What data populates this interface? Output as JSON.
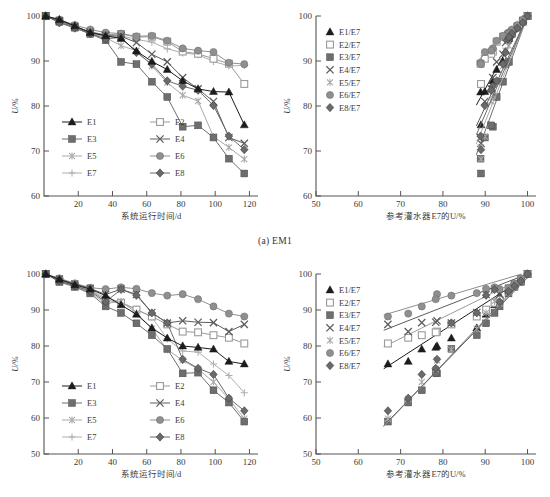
{
  "figure": {
    "caption_a": "(a) EM1"
  },
  "series_colors": {
    "E1": "#1c1c1c",
    "E2": "#9a9a9a",
    "E3": "#6e6e6e",
    "E4": "#5c5c5c",
    "E5": "#a9a9a9",
    "E6": "#8f8f8f",
    "E7": "#b0b0b0",
    "E8": "#6a6a6a"
  },
  "series_markers": {
    "E1": "triangle-filled",
    "E2": "square-open",
    "E3": "square-filled",
    "E4": "cross-x",
    "E5": "asterisk",
    "E6": "circle-filled",
    "E7": "plus",
    "E8": "diamond-filled"
  },
  "panel_top_left": {
    "legend": [
      "E1",
      "E2",
      "E3",
      "E4",
      "E5",
      "E6",
      "E7",
      "E8"
    ],
    "chart_data": {
      "type": "line",
      "title": "",
      "xlabel": "系统运行时间/d",
      "ylabel": "U/%",
      "xlim": [
        0,
        125
      ],
      "ylim": [
        60,
        100
      ],
      "xticks": [
        20,
        40,
        60,
        80,
        100,
        120
      ],
      "yticks": [
        60,
        70,
        80,
        90,
        100
      ],
      "grid": false,
      "x": [
        1,
        9,
        18,
        27,
        36,
        45,
        54,
        63,
        72,
        81,
        90,
        99,
        108,
        117
      ],
      "series": [
        {
          "name": "E1",
          "values": [
            100,
            99.2,
            97.8,
            96.3,
            95.6,
            95.0,
            92.2,
            89.9,
            88.1,
            85.6,
            83.8,
            83.2,
            83.1,
            75.8
          ]
        },
        {
          "name": "E2",
          "values": [
            100,
            98.9,
            97.6,
            96.5,
            95.8,
            96.0,
            95.3,
            95.4,
            94.3,
            92.1,
            91.6,
            90.5,
            89.4,
            84.9
          ]
        },
        {
          "name": "E3",
          "values": [
            100,
            98.7,
            97.4,
            96.0,
            94.6,
            89.8,
            89.3,
            85.4,
            82.0,
            75.4,
            75.7,
            73.0,
            68.3,
            65.0
          ]
        },
        {
          "name": "E4",
          "values": [
            100,
            99.0,
            97.7,
            96.4,
            95.7,
            95.5,
            94.1,
            91.5,
            89.8,
            86.3,
            83.8,
            81.0,
            73.0,
            71.7
          ]
        },
        {
          "name": "E5",
          "values": [
            100,
            98.8,
            97.5,
            96.2,
            95.2,
            93.4,
            92.3,
            88.9,
            85.2,
            82.4,
            81.1,
            73.2,
            70.8,
            68.2
          ]
        },
        {
          "name": "E6",
          "values": [
            100,
            99.2,
            98.0,
            97.0,
            96.3,
            96.1,
            95.5,
            95.6,
            94.5,
            92.8,
            92.3,
            92.0,
            89.6,
            89.3
          ]
        },
        {
          "name": "E7",
          "values": [
            100,
            98.9,
            97.6,
            96.3,
            95.4,
            95.6,
            94.8,
            94.2,
            92.7,
            91.8,
            91.4,
            89.9,
            88.9,
            89.0
          ]
        },
        {
          "name": "E8",
          "values": [
            100,
            98.5,
            97.3,
            96.1,
            94.9,
            95.3,
            91.9,
            89.3,
            85.6,
            84.4,
            83.5,
            80.1,
            73.3,
            70.3
          ]
        }
      ]
    }
  },
  "panel_top_right": {
    "legend": [
      "E1/E7",
      "E2/E7",
      "E3/E7",
      "E4/E7",
      "E5/E7",
      "E6/E7",
      "E8/E7"
    ],
    "chart_data": {
      "type": "scatter",
      "title": "",
      "xlabel": "参考灌水器E7的U/%",
      "ylabel": "U/%",
      "xlim": [
        50,
        102
      ],
      "ylim": [
        60,
        100
      ],
      "xticks": [
        50,
        60,
        70,
        80,
        90,
        100
      ],
      "yticks": [
        60,
        70,
        80,
        90,
        100
      ],
      "grid": false,
      "x_reference_E7": [
        100,
        98.9,
        97.6,
        96.3,
        95.4,
        95.6,
        94.8,
        94.2,
        92.7,
        91.8,
        91.4,
        89.9,
        88.9,
        89.0
      ],
      "series": [
        {
          "name": "E1/E7",
          "values": [
            100,
            99.2,
            97.8,
            96.3,
            95.6,
            95.0,
            92.2,
            89.9,
            88.1,
            85.6,
            83.8,
            83.2,
            83.1,
            75.8
          ],
          "fit_slope": 1.72,
          "fit_intercept": -71.0
        },
        {
          "name": "E2/E7",
          "values": [
            100,
            98.9,
            97.6,
            96.5,
            95.8,
            96.0,
            95.3,
            95.4,
            94.3,
            92.1,
            91.6,
            90.5,
            89.4,
            84.9
          ],
          "fit_slope": 0.92,
          "fit_intercept": 8.3
        },
        {
          "name": "E3/E7",
          "values": [
            100,
            98.7,
            97.4,
            96.0,
            94.6,
            89.8,
            89.3,
            85.4,
            82.0,
            75.4,
            75.7,
            73.0,
            68.3,
            65.0
          ],
          "fit_slope": 2.55,
          "fit_intercept": -155.0
        },
        {
          "name": "E4/E7",
          "values": [
            100,
            99.0,
            97.7,
            96.4,
            95.7,
            95.5,
            94.1,
            91.5,
            89.8,
            86.3,
            83.8,
            81.0,
            73.0,
            71.7
          ],
          "fit_slope": 2.02,
          "fit_intercept": -102.0
        },
        {
          "name": "E5/E7",
          "values": [
            100,
            98.8,
            97.5,
            96.2,
            95.2,
            93.4,
            92.3,
            88.9,
            85.2,
            82.4,
            81.1,
            73.2,
            70.8,
            68.2
          ],
          "fit_slope": 2.35,
          "fit_intercept": -135.0
        },
        {
          "name": "E6/E7",
          "values": [
            100,
            99.2,
            98.0,
            97.0,
            96.3,
            96.1,
            95.5,
            95.6,
            94.5,
            92.8,
            92.3,
            92.0,
            89.6,
            89.3
          ],
          "fit_slope": 0.88,
          "fit_intercept": 12.4
        },
        {
          "name": "E8/E7",
          "values": [
            100,
            98.5,
            97.3,
            96.1,
            94.9,
            95.3,
            91.9,
            89.3,
            85.6,
            84.4,
            83.5,
            80.1,
            73.3,
            70.3
          ],
          "fit_slope": 2.18,
          "fit_intercept": -118.0
        }
      ]
    }
  },
  "panel_bottom_left": {
    "legend": [
      "E1",
      "E2",
      "E3",
      "E4",
      "E5",
      "E6",
      "E7",
      "E8"
    ],
    "chart_data": {
      "type": "line",
      "title": "",
      "xlabel": "系统运行时间/d",
      "ylabel": "U/%",
      "xlim": [
        0,
        125
      ],
      "ylim": [
        50,
        100
      ],
      "xticks": [
        20,
        40,
        60,
        80,
        100,
        120
      ],
      "yticks": [
        50,
        60,
        70,
        80,
        90,
        100
      ],
      "grid": false,
      "x": [
        1,
        9,
        18,
        27,
        36,
        45,
        54,
        63,
        72,
        81,
        90,
        99,
        108,
        117
      ],
      "series": [
        {
          "name": "E1",
          "values": [
            100,
            98.5,
            97.0,
            95.8,
            94.0,
            91.4,
            88.8,
            85.0,
            82.2,
            80.0,
            79.6,
            79.1,
            75.7,
            75.0
          ]
        },
        {
          "name": "E2",
          "values": [
            100,
            98.0,
            96.7,
            95.4,
            92.8,
            92.0,
            90.1,
            88.2,
            86.0,
            84.0,
            83.8,
            83.0,
            82.3,
            80.7
          ]
        },
        {
          "name": "E3",
          "values": [
            100,
            97.8,
            96.4,
            94.6,
            91.0,
            89.2,
            86.3,
            83.0,
            79.2,
            72.4,
            72.6,
            67.7,
            64.3,
            59.0
          ]
        },
        {
          "name": "E4",
          "values": [
            100,
            98.6,
            97.2,
            96.0,
            94.3,
            95.8,
            94.3,
            89.3,
            86.4,
            87.0,
            86.6,
            86.5,
            84.0,
            86.0
          ]
        },
        {
          "name": "E5",
          "values": [
            100,
            98.2,
            96.5,
            94.9,
            91.8,
            92.4,
            89.2,
            84.8,
            79.0,
            76.0,
            73.6,
            70.0,
            65.3,
            59.8
          ]
        },
        {
          "name": "E6",
          "values": [
            100,
            98.8,
            97.4,
            96.2,
            95.8,
            96.3,
            95.9,
            94.7,
            94.0,
            94.4,
            93.0,
            91.0,
            89.0,
            88.2
          ]
        },
        {
          "name": "E7",
          "values": [
            100,
            98.4,
            96.9,
            95.5,
            93.4,
            92.2,
            90.2,
            88.0,
            82.0,
            78.6,
            78.3,
            75.0,
            71.8,
            67.0
          ]
        },
        {
          "name": "E8",
          "values": [
            100,
            98.1,
            96.7,
            95.2,
            92.3,
            95.7,
            94.1,
            89.2,
            86.4,
            76.3,
            73.8,
            72.1,
            65.5,
            62.0
          ]
        }
      ]
    }
  },
  "panel_bottom_right": {
    "legend": [
      "E1/E7",
      "E2/E7",
      "E3/E7",
      "E4/E7",
      "E5/E7",
      "E6/E7",
      "E8/E7"
    ],
    "chart_data": {
      "type": "scatter",
      "title": "",
      "xlabel": "参考灌水器E7的U/%",
      "ylabel": "U/%",
      "xlim": [
        50,
        102
      ],
      "ylim": [
        50,
        100
      ],
      "xticks": [
        50,
        60,
        70,
        80,
        90,
        100
      ],
      "yticks": [
        50,
        60,
        70,
        80,
        90,
        100
      ],
      "grid": false,
      "x_reference_E7": [
        100,
        98.4,
        96.9,
        95.5,
        93.4,
        92.2,
        90.2,
        88.0,
        82.0,
        78.6,
        78.3,
        75.0,
        71.8,
        67.0
      ],
      "series": [
        {
          "name": "E1/E7",
          "values": [
            100,
            98.5,
            97.0,
            95.8,
            94.0,
            91.4,
            88.8,
            85.0,
            82.2,
            80.0,
            79.6,
            79.1,
            75.7,
            75.0
          ],
          "fit_slope": 0.76,
          "fit_intercept": 23.5
        },
        {
          "name": "E2/E7",
          "values": [
            100,
            98.0,
            96.7,
            95.4,
            92.8,
            92.0,
            90.1,
            88.2,
            86.0,
            84.0,
            83.8,
            83.0,
            82.3,
            80.7
          ],
          "fit_slope": 0.58,
          "fit_intercept": 41.5
        },
        {
          "name": "E3/E7",
          "values": [
            100,
            97.8,
            96.4,
            94.6,
            91.0,
            89.2,
            86.3,
            83.0,
            79.2,
            72.4,
            72.6,
            67.7,
            64.3,
            59.0
          ],
          "fit_slope": 1.24,
          "fit_intercept": -24.2
        },
        {
          "name": "E4/E7",
          "values": [
            100,
            98.6,
            97.2,
            96.0,
            94.3,
            95.8,
            94.3,
            89.3,
            86.4,
            87.0,
            86.6,
            86.5,
            84.0,
            86.0
          ],
          "fit_slope": 0.46,
          "fit_intercept": 54.0
        },
        {
          "name": "E5/E7",
          "values": [
            100,
            98.2,
            96.5,
            94.9,
            91.8,
            92.4,
            89.2,
            84.8,
            79.0,
            76.0,
            73.6,
            70.0,
            65.3,
            59.8
          ],
          "fit_slope": 1.22,
          "fit_intercept": -22.8
        },
        {
          "name": "E6/E7",
          "values": [
            100,
            98.8,
            97.4,
            96.2,
            95.8,
            96.3,
            95.9,
            94.7,
            94.0,
            94.4,
            93.0,
            91.0,
            89.0,
            88.2
          ],
          "fit_slope": 0.35,
          "fit_intercept": 65.5
        },
        {
          "name": "E8/E7",
          "values": [
            100,
            98.1,
            96.7,
            95.2,
            92.3,
            95.7,
            94.1,
            89.2,
            86.4,
            76.3,
            73.8,
            72.1,
            65.5,
            62.0
          ],
          "fit_slope": 1.21,
          "fit_intercept": -22.0
        }
      ]
    }
  }
}
